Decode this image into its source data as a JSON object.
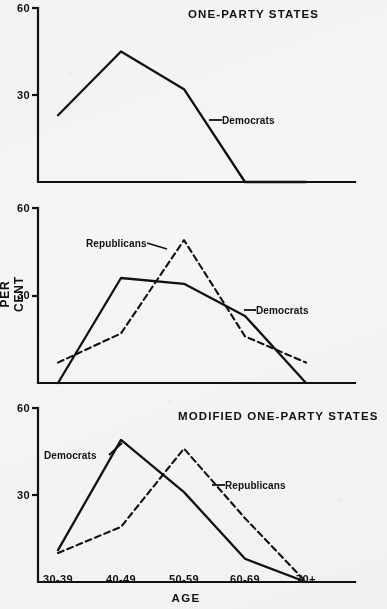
{
  "figure": {
    "axis_y_title": "PER CENT",
    "axis_x_title": "AGE",
    "y_ticks": [
      "60",
      "30"
    ],
    "x_ticks": [
      "30-39",
      "40-49",
      "50-59",
      "60-69",
      "70+"
    ]
  },
  "panels": [
    {
      "title": "ONE-PARTY STATES",
      "labels": {
        "democrats": "Democrats"
      }
    },
    {
      "title": "MODIFIED ONE-PARTY STATES",
      "labels": {
        "republicans": "Republicans",
        "democrats": "Democrats"
      }
    },
    {
      "title": "TWO-PARTY STATES",
      "labels": {
        "democrats": "Democrats",
        "republicans": "Republicans"
      }
    }
  ],
  "chart_data": [
    {
      "type": "line",
      "title": "ONE-PARTY STATES",
      "xlabel": "AGE",
      "ylabel": "PER CENT",
      "ylim": [
        0,
        60
      ],
      "yticks": [
        30,
        60
      ],
      "grid": false,
      "legend": "inline-annotations",
      "categories": [
        "30-39",
        "40-49",
        "50-59",
        "60-69",
        "70+"
      ],
      "series": [
        {
          "name": "Democrats",
          "style": "solid",
          "values": [
            23,
            45,
            32,
            0,
            0
          ]
        }
      ]
    },
    {
      "type": "line",
      "title": "MODIFIED ONE-PARTY STATES",
      "xlabel": "AGE",
      "ylabel": "PER CENT",
      "ylim": [
        0,
        60
      ],
      "yticks": [
        30,
        60
      ],
      "grid": false,
      "legend": "inline-annotations",
      "categories": [
        "30-39",
        "40-49",
        "50-59",
        "60-69",
        "70+"
      ],
      "series": [
        {
          "name": "Democrats",
          "style": "solid",
          "values": [
            0,
            36,
            34,
            23,
            0
          ]
        },
        {
          "name": "Republicans",
          "style": "dashed",
          "values": [
            7,
            17,
            49,
            16,
            7
          ]
        }
      ]
    },
    {
      "type": "line",
      "title": "TWO-PARTY STATES",
      "xlabel": "AGE",
      "ylabel": "PER CENT",
      "ylim": [
        0,
        60
      ],
      "yticks": [
        30,
        60
      ],
      "grid": false,
      "legend": "inline-annotations",
      "categories": [
        "30-39",
        "40-49",
        "50-59",
        "60-69",
        "70+"
      ],
      "series": [
        {
          "name": "Democrats",
          "style": "solid",
          "values": [
            11,
            49,
            31,
            8,
            0
          ]
        },
        {
          "name": "Republicans",
          "style": "dashed",
          "values": [
            10,
            19,
            46,
            22,
            0
          ]
        }
      ]
    }
  ],
  "colors": {
    "ink": "#111111",
    "paper": "#f5f5f4"
  }
}
